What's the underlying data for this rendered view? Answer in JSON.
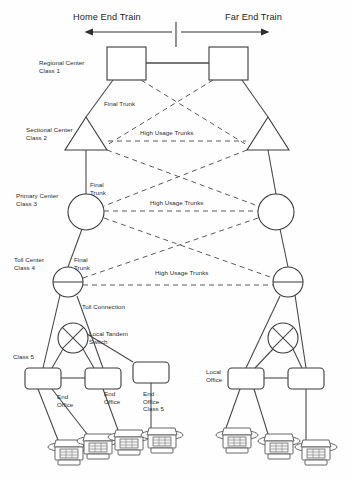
{
  "diagram": {
    "title_left": "Home End Train",
    "title_right": "Far End Train",
    "hierarchy_labels": {
      "regional": "Regional Center\nClass 1",
      "sectional": "Sectional Center\nClass 2",
      "primary": "Primary Center\nClass 3",
      "toll": "Toll Center\nClass 4",
      "class5": "Class 5",
      "local_office": "Local\nOffice"
    },
    "link_labels": {
      "final_trunk_1": "Final Trunk",
      "final_trunk_2": "Final\nTrunk",
      "final_trunk_3": "Final\nTrunk",
      "high_usage_1": "High Usage Trunks",
      "high_usage_2": "High Usage Trunks",
      "high_usage_3": "High Usage Trunks",
      "toll_connection": "Toll Connection",
      "local_tandem": "Local Tandem\nSwitch"
    },
    "end_office_labels": {
      "eo_1": "End\nOffice",
      "eo_2": "End\nOffice",
      "eo_3": "End\nOffice\nClass 5"
    },
    "colors": {
      "stroke": "#4a4a4a",
      "dashed_stroke": "#5a5a5a",
      "text": "#2b2b2b",
      "background": "#ffffff"
    }
  }
}
